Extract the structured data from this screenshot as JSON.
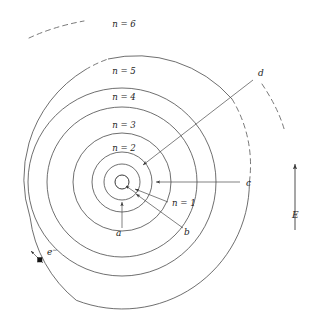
{
  "figure": {
    "kind": "bohr-model-energy-level-diagram",
    "background_color": "#ffffff",
    "line_color": "#4a4a4a"
  },
  "shells": [
    {
      "id": "n1",
      "label": "n = 1",
      "n": 1,
      "radius": 18,
      "label_x": 172,
      "label_y": 206,
      "dashed": false
    },
    {
      "id": "n2",
      "label": "n = 2",
      "n": 2,
      "radius": 30,
      "label_x": 124,
      "label_y": 151,
      "dashed": false
    },
    {
      "id": "n3",
      "label": "n = 3",
      "n": 3,
      "radius": 49,
      "label_x": 124,
      "label_y": 128,
      "dashed": false
    },
    {
      "id": "n4",
      "label": "n = 4",
      "n": 4,
      "radius": 75,
      "label_x": 124,
      "label_y": 100,
      "dashed": false
    },
    {
      "id": "n5",
      "label": "n = 5",
      "n": 5,
      "radius": 94,
      "label_x": 124,
      "label_y": 74,
      "dashed": false
    },
    {
      "id": "n6",
      "label": "n = 6",
      "n": 6,
      "radius": 127,
      "label_x": 124,
      "label_y": 27,
      "dashed": true
    }
  ],
  "nucleus": {
    "label": "",
    "radius": 7,
    "cx": 122,
    "cy": 182
  },
  "transitions": [
    {
      "id": "a",
      "label": "a",
      "label_x": 116,
      "label_y": 236,
      "from_shell": "n3",
      "to_shell": "n1",
      "direction": "inward-from-below"
    },
    {
      "id": "b",
      "label": "b",
      "label_x": 184,
      "label_y": 235,
      "from_shell": "n4",
      "to_shell": "n1",
      "direction": "inward-from-lower-right"
    },
    {
      "id": "c",
      "label": "c",
      "label_x": 246,
      "label_y": 186,
      "from_shell": "n6",
      "to_shell": "n2",
      "direction": "inward-from-right"
    },
    {
      "id": "d",
      "label": "d",
      "label_x": 258,
      "label_y": 76,
      "from_shell": "n6",
      "to_shell": "n2",
      "direction": "inward-from-upper-right"
    }
  ],
  "electron": {
    "label": "e",
    "charge_superscript": "−",
    "dot_x": 40,
    "dot_y": 260,
    "label_x": 47,
    "label_y": 255,
    "on_shell": "n6"
  },
  "energy_axis": {
    "label": "E",
    "label_x": 292,
    "label_y": 218,
    "arrow_x": 295,
    "arrow_top_y": 162,
    "arrow_bottom_y": 230,
    "direction": "up"
  }
}
